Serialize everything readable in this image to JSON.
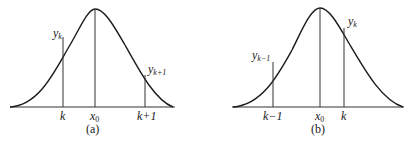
{
  "panels": [
    {
      "id": "a",
      "caption": "(a)",
      "x_labels": {
        "left": "k",
        "center": "x0",
        "right": "k+1"
      },
      "ordinate_labels": {
        "left": "y",
        "left_sub": "k",
        "right": "y",
        "right_sub": "k+1"
      }
    },
    {
      "id": "b",
      "caption": "(b)",
      "x_labels": {
        "left": "k−1",
        "center": "x0",
        "right": "k"
      },
      "ordinate_labels": {
        "left": "y",
        "left_sub": "k−1",
        "right": "y",
        "right_sub": "k"
      }
    }
  ],
  "x0": {
    "base": "x",
    "sub": "0"
  }
}
